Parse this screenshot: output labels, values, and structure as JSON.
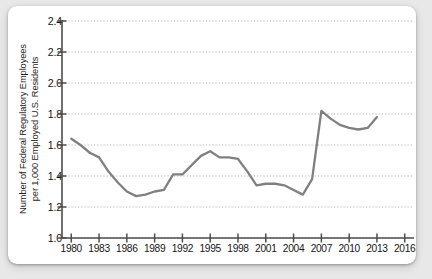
{
  "card": {
    "background": "#ffffff",
    "page_background": "#e8e8e8"
  },
  "chart_data": {
    "type": "line",
    "title": "",
    "xlabel": "",
    "ylabel": "Number of Federal Regulatory Employees per 1,000 Employed U.S. Residents",
    "ylabel_line1": "Number of Federal Regulatory Employees",
    "ylabel_line2": "per 1,000 Employed U.S. Residents",
    "xlim": [
      1979,
      2017
    ],
    "ylim": [
      1.0,
      2.4
    ],
    "ytick_labels": [
      "2.4",
      "2.2",
      "2.0",
      "1.8",
      "1.6",
      "1.4",
      "1.2",
      "1.0"
    ],
    "ytick_values": [
      2.4,
      2.2,
      2.0,
      1.8,
      1.6,
      1.4,
      1.2,
      1.0
    ],
    "xtick_labels": [
      "1980",
      "1983",
      "1986",
      "1989",
      "1992",
      "1995",
      "1998",
      "2001",
      "2004",
      "2007",
      "2010",
      "2013",
      "2016"
    ],
    "xtick_values": [
      1980,
      1983,
      1986,
      1989,
      1992,
      1995,
      1998,
      2001,
      2004,
      2007,
      2010,
      2013,
      2016
    ],
    "grid": "horizontal-dotted",
    "legend": "none",
    "line_color": "#808080",
    "axis_color": "#4d4d4d",
    "grid_color": "#999999",
    "x": [
      1980,
      1981,
      1982,
      1983,
      1984,
      1985,
      1986,
      1987,
      1988,
      1989,
      1990,
      1991,
      1992,
      1993,
      1994,
      1995,
      1996,
      1997,
      1998,
      1999,
      2000,
      2001,
      2002,
      2003,
      2004,
      2005,
      2006,
      2007,
      2008,
      2009,
      2010,
      2011,
      2012,
      2013
    ],
    "values": [
      1.64,
      1.6,
      1.55,
      1.52,
      1.43,
      1.36,
      1.3,
      1.27,
      1.28,
      1.3,
      1.31,
      1.41,
      1.41,
      1.47,
      1.53,
      1.56,
      1.52,
      1.52,
      1.51,
      1.43,
      1.34,
      1.35,
      1.35,
      1.34,
      1.31,
      1.28,
      1.38,
      1.82,
      1.77,
      1.73,
      1.71,
      1.7,
      1.71,
      1.78
    ],
    "series": [
      {
        "name": "Federal regulatory employees per 1,000 employed U.S. residents",
        "points": [
          {
            "x": 1980,
            "y": 1.64
          },
          {
            "x": 1981,
            "y": 1.6
          },
          {
            "x": 1982,
            "y": 1.55
          },
          {
            "x": 1983,
            "y": 1.52
          },
          {
            "x": 1984,
            "y": 1.43
          },
          {
            "x": 1985,
            "y": 1.36
          },
          {
            "x": 1986,
            "y": 1.3
          },
          {
            "x": 1987,
            "y": 1.27
          },
          {
            "x": 1988,
            "y": 1.28
          },
          {
            "x": 1989,
            "y": 1.3
          },
          {
            "x": 1990,
            "y": 1.31
          },
          {
            "x": 1991,
            "y": 1.41
          },
          {
            "x": 1992,
            "y": 1.41
          },
          {
            "x": 1993,
            "y": 1.47
          },
          {
            "x": 1994,
            "y": 1.53
          },
          {
            "x": 1995,
            "y": 1.56
          },
          {
            "x": 1996,
            "y": 1.52
          },
          {
            "x": 1997,
            "y": 1.52
          },
          {
            "x": 1998,
            "y": 1.51
          },
          {
            "x": 1999,
            "y": 1.43
          },
          {
            "x": 2000,
            "y": 1.34
          },
          {
            "x": 2001,
            "y": 1.35
          },
          {
            "x": 2002,
            "y": 1.35
          },
          {
            "x": 2003,
            "y": 1.34
          },
          {
            "x": 2004,
            "y": 1.31
          },
          {
            "x": 2005,
            "y": 1.28
          },
          {
            "x": 2006,
            "y": 1.38
          },
          {
            "x": 2007,
            "y": 1.82
          },
          {
            "x": 2008,
            "y": 1.77
          },
          {
            "x": 2009,
            "y": 1.73
          },
          {
            "x": 2010,
            "y": 1.71
          },
          {
            "x": 2011,
            "y": 1.7
          },
          {
            "x": 2012,
            "y": 1.71
          },
          {
            "x": 2013,
            "y": 1.78
          }
        ]
      }
    ]
  }
}
